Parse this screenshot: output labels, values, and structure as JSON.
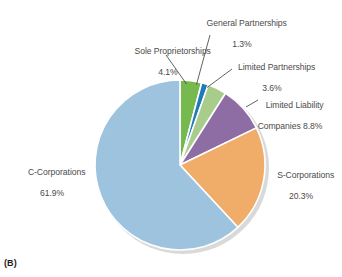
{
  "figure": {
    "caption": "(B)",
    "background_color": "#ffffff",
    "label_color": "#4b4b4b"
  },
  "chart_data": {
    "type": "pie",
    "title": "",
    "xlabel": "",
    "ylabel": "",
    "legend_position": "none",
    "grid": false,
    "start_angle_deg": 0,
    "direction": "clockwise",
    "units": "percent",
    "categories": [
      "Sole Proprietorships",
      "General Partnerships",
      "Limited Partnerships",
      "Limited Liability Companies",
      "S-Corporations",
      "C-Corporations"
    ],
    "values": [
      4.1,
      1.3,
      3.6,
      8.8,
      20.3,
      61.9
    ],
    "colors": [
      "#76b94e",
      "#1f7ab5",
      "#a8cc8c",
      "#8e6da5",
      "#f0ac69",
      "#9dc3de"
    ],
    "slices": [
      {
        "name": "Sole Proprietorships",
        "value": 4.1,
        "label_line1": "Sole Proprietorships",
        "label_line2": "4.1%",
        "color": "#76b94e",
        "has_leader_line": true
      },
      {
        "name": "General Partnerships",
        "value": 1.3,
        "label_line1": "General Partnerships",
        "label_line2": "1.3%",
        "color": "#1f7ab5",
        "has_leader_line": true
      },
      {
        "name": "Limited Partnerships",
        "value": 3.6,
        "label_line1": "Limited Partnerships",
        "label_line2": "3.6%",
        "color": "#a8cc8c",
        "has_leader_line": true
      },
      {
        "name": "Limited Liability Companies",
        "value": 8.8,
        "label_line1": "Limited Liability",
        "label_line2": "Companies 8.8%",
        "color": "#8e6da5",
        "has_leader_line": true
      },
      {
        "name": "S-Corporations",
        "value": 20.3,
        "label_line1": "S-Corporations",
        "label_line2": "20.3%",
        "color": "#f0ac69",
        "has_leader_line": false
      },
      {
        "name": "C-Corporations",
        "value": 61.9,
        "label_line1": "C-Corporations",
        "label_line2": "61.9%",
        "color": "#9dc3de",
        "has_leader_line": false
      }
    ]
  }
}
